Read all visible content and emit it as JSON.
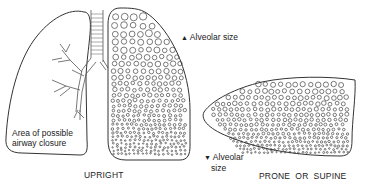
{
  "diagram": {
    "type": "lung alveolar size distribution",
    "upright": {
      "caption": "UPRIGHT",
      "left_lung_label_line1": "Area of possible",
      "left_lung_label_line2": "airway closure"
    },
    "annotations": {
      "top_arrow": "▲",
      "top_label": "Alveolar size",
      "bottom_arrow": "▼",
      "bottom_label_line1": "Alveolar",
      "bottom_label_line2": "size"
    },
    "prone": {
      "caption": "PRONE  OR  SUPINE"
    },
    "colors": {
      "line": "#333333",
      "background": "#ffffff"
    }
  }
}
